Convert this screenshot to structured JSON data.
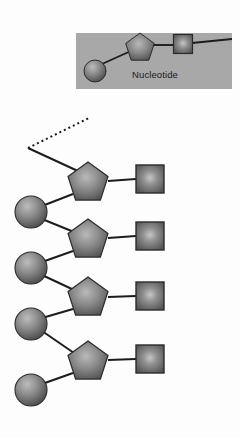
{
  "figure": {
    "background_color": "#fdfdfd"
  },
  "legend": {
    "name": "nucleotide-legend",
    "label": "Nucleotide",
    "box": {
      "x": 76,
      "y": 33,
      "width": 156,
      "height": 56,
      "fill": "#a8a8a8"
    },
    "units": [
      {
        "shape": "circle",
        "name": "phosphate-circle",
        "cx": 95,
        "cy": 71,
        "r": 11
      },
      {
        "shape": "pentagon",
        "name": "sugar-pentagon",
        "cx": 140,
        "cy": 48,
        "r": 15
      },
      {
        "shape": "square",
        "name": "base-square",
        "cx": 183,
        "cy": 44,
        "size": 19
      }
    ],
    "connector_end_x": 232
  },
  "shape_styles": {
    "fill_center": "#b4b4b4",
    "fill_edge": "#4f4f4f",
    "stroke": "#2b2b2b",
    "stroke_width": 1.1,
    "bond_color": "#1c1c1c",
    "bond_width": 2.0
  },
  "chain": {
    "name": "nucleotide-chain",
    "dashed_bond": {
      "name": "dashed-continuation-bond",
      "x1": 28,
      "y1": 148,
      "x2": 89,
      "y2": 118,
      "dash": "2,3"
    },
    "circles": [
      {
        "name": "phosphate-1",
        "cx": 31,
        "cy": 212,
        "r": 16
      },
      {
        "name": "phosphate-2",
        "cx": 31,
        "cy": 268,
        "r": 16
      },
      {
        "name": "phosphate-3",
        "cx": 31,
        "cy": 324,
        "r": 16
      },
      {
        "name": "phosphate-4",
        "cx": 31,
        "cy": 390,
        "r": 16
      },
      {
        "name": "phosphate-5",
        "cx": 31,
        "cy": 268,
        "r": 16
      }
    ],
    "circle_list": [
      {
        "name": "phosphate-1",
        "cx": 31,
        "cy": 212,
        "r": 16
      },
      {
        "name": "phosphate-2",
        "cx": 31,
        "cy": 268,
        "r": 16
      },
      {
        "name": "phosphate-3",
        "cx": 31,
        "cy": 324,
        "r": 16
      },
      {
        "name": "phosphate-4",
        "cx": 31,
        "cy": 390,
        "r": 16
      }
    ],
    "pentagons": [
      {
        "name": "sugar-1",
        "cx": 88,
        "cy": 183,
        "r": 21
      },
      {
        "name": "sugar-2",
        "cx": 88,
        "cy": 240,
        "r": 21
      },
      {
        "name": "sugar-3",
        "cx": 88,
        "cy": 298,
        "r": 21
      },
      {
        "name": "sugar-4",
        "cx": 88,
        "cy": 362,
        "r": 21
      }
    ],
    "squares": [
      {
        "name": "base-1",
        "cx": 150,
        "cy": 179,
        "size": 28
      },
      {
        "name": "base-2",
        "cx": 150,
        "cy": 236,
        "size": 28
      },
      {
        "name": "base-3",
        "cx": 150,
        "cy": 296,
        "size": 28
      },
      {
        "name": "base-4",
        "cx": 150,
        "cy": 359,
        "size": 28
      }
    ],
    "counts": {
      "phosphates": 5,
      "sugars": 4,
      "bases": 4
    }
  }
}
